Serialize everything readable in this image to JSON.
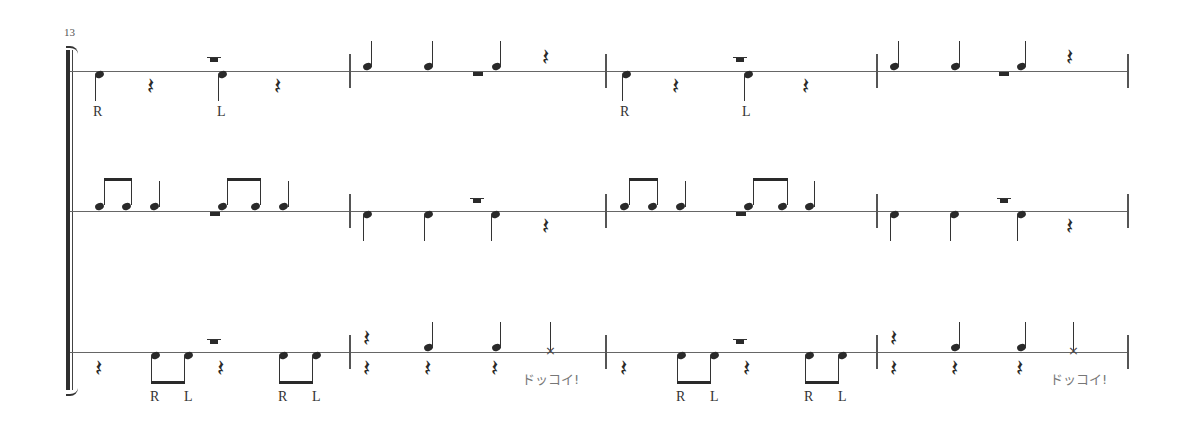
{
  "score": {
    "measure_number": "13",
    "staff_count": 3,
    "measures_per_system": 4,
    "staves": [
      {
        "name": "staff-1",
        "measures": [
          {
            "pattern": "quarter-down (R), quarter-rest, accented quarter-down (L), quarter-rest",
            "sticking": [
              "R",
              "L"
            ]
          },
          {
            "pattern": "quarter-up, quarter-up, quarter-up (ledger), quarter-rest"
          },
          {
            "pattern": "quarter-down (R), quarter-rest, accented quarter-down (L), quarter-rest",
            "sticking": [
              "R",
              "L"
            ]
          },
          {
            "pattern": "quarter-up, quarter-up, quarter-up (ledger), quarter-rest"
          }
        ]
      },
      {
        "name": "staff-2",
        "measures": [
          {
            "pattern": "beamed eighths, quarter, beamed eighths (ledger), quarter"
          },
          {
            "pattern": "quarter-down, quarter-down, accented quarter-down, quarter-rest"
          },
          {
            "pattern": "beamed eighths, quarter, beamed eighths (ledger), quarter"
          },
          {
            "pattern": "quarter-down, quarter-down, accented quarter-down, quarter-rest"
          }
        ]
      },
      {
        "name": "staff-3",
        "measures": [
          {
            "pattern": "rest, beamed eighths down (R L), accented rest, beamed eighths down (R L)",
            "sticking": [
              "R",
              "L",
              "R",
              "L"
            ]
          },
          {
            "pattern": "two-voice: rests / quarter-ups, x-head shout",
            "shout": "ドッコイ!"
          },
          {
            "pattern": "rest, beamed eighths down (R L), accented rest, beamed eighths down (R L)",
            "sticking": [
              "R",
              "L",
              "R",
              "L"
            ]
          },
          {
            "pattern": "two-voice: rests / quarter-ups, x-head shout",
            "shout": "ドッコイ!"
          }
        ]
      }
    ],
    "labels": {
      "R": "R",
      "L": "L",
      "shout": "ドッコイ!",
      "rest_glyph": "𝄽",
      "xhead_glyph": "×"
    }
  }
}
